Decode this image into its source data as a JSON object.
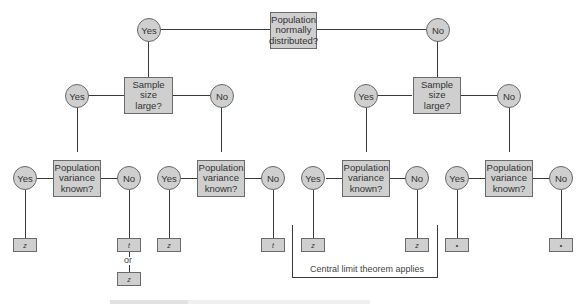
{
  "diagram": {
    "type": "decision-tree",
    "root": {
      "label": "Population\nnormally\ndistributed?"
    },
    "branches": {
      "yes": "Yes",
      "no": "No"
    },
    "sample_size_question": "Sample\nsize\nlarge?",
    "variance_question": "Population\nvariance\nknown?",
    "answers": {
      "yes": "Yes",
      "no": "No"
    },
    "leaves": {
      "z": "z",
      "t": "t",
      "or": "or",
      "none": "•"
    },
    "bracket_label": "Central limit theorem applies"
  }
}
